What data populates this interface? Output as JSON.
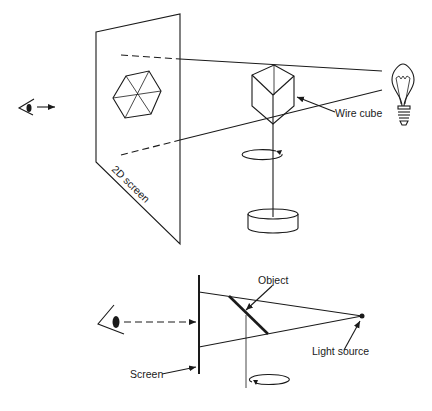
{
  "top_diagram": {
    "screen_label": "2D screen",
    "cube_label": "Wire cube",
    "elements": [
      "eye-icon",
      "view-arrow",
      "2d-screen",
      "hexagon-projection",
      "wire-cube",
      "light-bulb",
      "rotation-arrow",
      "stand-base"
    ]
  },
  "bottom_diagram": {
    "object_label": "Object",
    "light_label": "Light source",
    "screen_label": "Screen",
    "elements": [
      "eye-icon",
      "dashed-view-arrow",
      "screen",
      "object",
      "light-source",
      "rotation-arrow"
    ]
  },
  "colors": {
    "ink": "#1a1a1a",
    "background": "#ffffff"
  }
}
